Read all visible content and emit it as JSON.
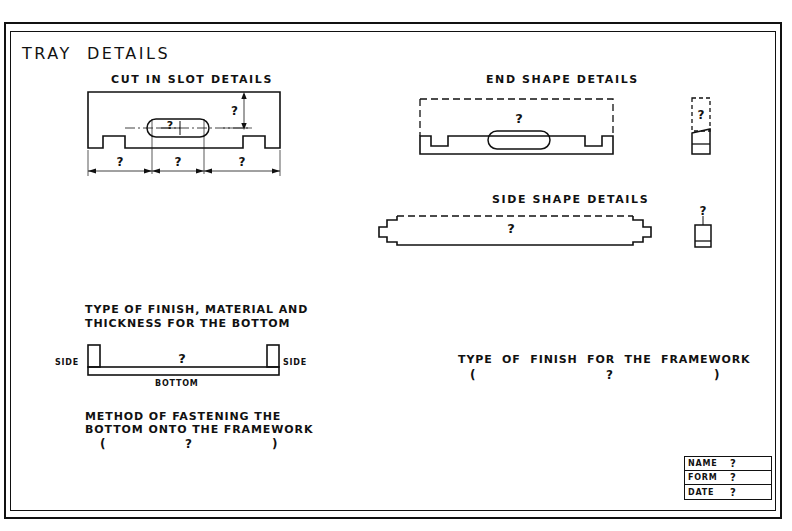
{
  "sheet": {
    "title": "TRAY  DETAILS",
    "placeholder": "?"
  },
  "sections": {
    "cut_in_slot": {
      "heading": "CUT IN SLOT DETAILS",
      "slot_width_label": "?",
      "slot_height_label": "?",
      "dim_left": "?",
      "dim_center": "?",
      "dim_right": "?"
    },
    "end_shape": {
      "heading": "END SHAPE DETAILS",
      "body_label": "?",
      "edge_view_label": "?"
    },
    "side_shape": {
      "heading": "SIDE SHAPE DETAILS",
      "body_label": "?",
      "edge_view_label": "?"
    },
    "bottom_finish": {
      "heading_line1": "TYPE OF FINISH, MATERIAL AND",
      "heading_line2": "THICKNESS FOR THE BOTTOM",
      "left_label": "SIDE",
      "right_label": "SIDE",
      "center_label": "?",
      "bottom_label": "BOTTOM"
    },
    "fastening": {
      "heading_line1": "METHOD OF FASTENING THE",
      "heading_line2": "BOTTOM ONTO THE FRAMEWORK",
      "open_paren": "(",
      "answer": "?",
      "close_paren": ")"
    },
    "framework_finish": {
      "heading": "TYPE  OF  FINISH  FOR  THE  FRAMEWORK",
      "open_paren": "(",
      "answer": "?",
      "close_paren": ")"
    }
  },
  "title_block": {
    "rows": [
      {
        "key": "NAME",
        "value": "?"
      },
      {
        "key": "FORM",
        "value": "?"
      },
      {
        "key": "DATE",
        "value": "?"
      }
    ]
  },
  "colors": {
    "ink": "#111111",
    "paper": "#ffffff"
  }
}
